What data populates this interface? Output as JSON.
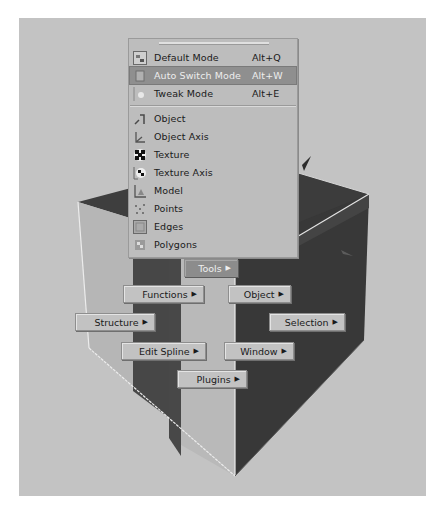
{
  "viewport": {
    "background": "#c3c3c3",
    "cube_colors": {
      "light_face": "#b4b4b4",
      "dark_face": "#3f3f3f",
      "mid_stripe": "#4a4a4a",
      "edge_highlight": "#e8e8e8"
    }
  },
  "mode_menu": {
    "items": [
      {
        "label": "Default Mode",
        "shortcut": "Alt+Q",
        "icon": "default-mode-icon",
        "highlighted": false
      },
      {
        "label": "Auto Switch Mode",
        "shortcut": "Alt+W",
        "icon": "auto-switch-mode-icon",
        "highlighted": true
      },
      {
        "label": "Tweak Mode",
        "shortcut": "Alt+E",
        "icon": "tweak-mode-icon",
        "highlighted": false
      }
    ],
    "tools": [
      {
        "label": "Object",
        "icon": "object-tool-icon"
      },
      {
        "label": "Object Axis",
        "icon": "object-axis-icon"
      },
      {
        "label": "Texture",
        "icon": "texture-icon"
      },
      {
        "label": "Texture Axis",
        "icon": "texture-axis-icon"
      },
      {
        "label": "Model",
        "icon": "model-icon"
      },
      {
        "label": "Points",
        "icon": "points-icon"
      },
      {
        "label": "Edges",
        "icon": "edges-icon"
      },
      {
        "label": "Polygons",
        "icon": "polygons-icon"
      }
    ]
  },
  "hud_menu": {
    "arrow": "▶",
    "buttons": {
      "tools": "Tools",
      "functions": "Functions",
      "object": "Object",
      "structure": "Structure",
      "selection": "Selection",
      "edit_spline": "Edit Spline",
      "window": "Window",
      "plugins": "Plugins"
    },
    "active": "Tools"
  }
}
